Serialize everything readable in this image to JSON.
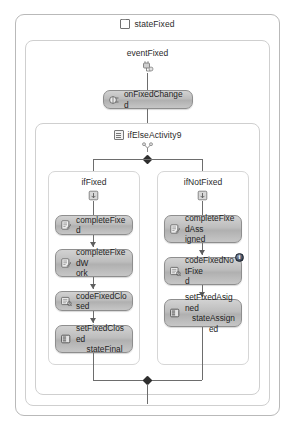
{
  "designer": {
    "state": {
      "title": "stateFixed",
      "icon": "state-icon"
    },
    "event_driven": {
      "title": "eventFixed",
      "icon": "event-handler-icon"
    },
    "handler_activity": {
      "label": "onFixedChanged",
      "icon": "handle-external-event-icon"
    },
    "ifelse": {
      "title": "ifElseActivity9",
      "title_icon": "ifelse-grid-icon",
      "icon": "ifelse-icon",
      "branches": [
        {
          "title": "ifFixed",
          "icon": "branch-icon",
          "activities": [
            {
              "label": "completeFixed",
              "line1": "completeFixed",
              "line2": "",
              "icon": "code-activity-icon",
              "badge": ""
            },
            {
              "label": "completeFixedWork",
              "line1": "completeFixedW",
              "line2": "ork",
              "icon": "code-activity-icon",
              "badge": ""
            },
            {
              "label": "codeFixedClosed",
              "line1": "codeFixedClosed",
              "line2": "",
              "icon": "code-condition-icon",
              "badge": ""
            },
            {
              "label": "setFixedClosed stateFinal",
              "line1": "setFixedClosed",
              "line2": "stateFinal",
              "icon": "set-state-icon",
              "badge": ""
            }
          ]
        },
        {
          "title": "ifNotFixed",
          "icon": "branch-icon",
          "activities": [
            {
              "label": "completeFixedAssigned",
              "line1": "completeFixedAss",
              "line2": "igned",
              "icon": "code-activity-icon",
              "badge": ""
            },
            {
              "label": "codeFixedNotFixed",
              "line1": "codeFixedNotFixe",
              "line2": "d",
              "icon": "code-condition-icon",
              "badge": "info-badge"
            },
            {
              "label": "setFixedAsigned stateAssigned",
              "line1": "setFixedAsigned",
              "line2": "stateAssigned",
              "icon": "set-state-icon",
              "badge": ""
            }
          ]
        }
      ]
    }
  },
  "colors": {
    "activity_fill_top": "#d2d2d2",
    "activity_fill_bottom": "#c6c6c6",
    "activity_border": "#8e8e8e",
    "frame_border": "#b9b9b9",
    "connector": "#6d6d6d",
    "badge": "#2b3340",
    "text": "#1e1e1e"
  }
}
